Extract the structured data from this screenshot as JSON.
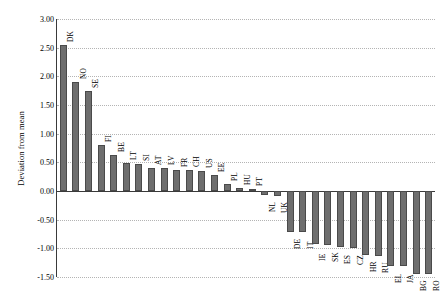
{
  "chart_data": {
    "type": "bar",
    "title": "",
    "xlabel": "",
    "ylabel": "Deviation from mean",
    "ylim": [
      -1.5,
      3.0
    ],
    "ytick_labels": [
      "3.00",
      "2.50",
      "2.00",
      "1.50",
      "1.00",
      "0.50",
      "0.00",
      "-0.50",
      "-1.00",
      "-1.50"
    ],
    "ytick_values": [
      3.0,
      2.5,
      2.0,
      1.5,
      1.0,
      0.5,
      0.0,
      -0.5,
      -1.0,
      -1.5
    ],
    "grid": true,
    "legend": "none",
    "categories": [
      "DK",
      "NO",
      "SE",
      "FI",
      "BE",
      "LT",
      "SI",
      "AT",
      "LV",
      "FR",
      "CH",
      "US",
      "EE",
      "PL",
      "HU",
      "PT",
      "NL",
      "UK",
      "DE",
      "IT",
      "IE",
      "SK",
      "ES",
      "CZ",
      "HR",
      "RU",
      "EL",
      "JA",
      "BG",
      "RO"
    ],
    "values": [
      2.55,
      1.9,
      1.75,
      0.8,
      0.63,
      0.48,
      0.47,
      0.4,
      0.4,
      0.36,
      0.36,
      0.35,
      0.28,
      0.12,
      0.05,
      0.04,
      -0.07,
      -0.08,
      -0.72,
      -0.72,
      -0.93,
      -0.95,
      -0.98,
      -1.0,
      -1.12,
      -1.14,
      -1.3,
      -1.3,
      -1.44,
      -1.45
    ]
  }
}
